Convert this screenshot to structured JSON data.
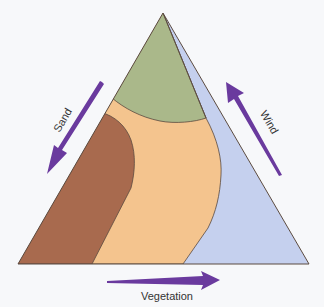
{
  "diagram": {
    "type": "ternary-triangle",
    "axes": [
      {
        "label": "Sand",
        "direction": "down-left",
        "side": "left"
      },
      {
        "label": "Wind",
        "direction": "up-left",
        "side": "right"
      },
      {
        "label": "Vegetation",
        "direction": "right",
        "side": "bottom"
      }
    ],
    "labels": {
      "sand": "Sand",
      "wind": "Wind",
      "vegetation": "Vegetation"
    },
    "regions": [
      {
        "name": "top-region",
        "color": "#AAB88A"
      },
      {
        "name": "left-region",
        "color": "#A86A4E"
      },
      {
        "name": "center-region",
        "color": "#F4C48E"
      },
      {
        "name": "right-region",
        "color": "#C5D0EE"
      }
    ],
    "colors": {
      "arrow": "#6A3A9E",
      "outline": "#5A4A40",
      "background": "#F7F8FA"
    }
  }
}
